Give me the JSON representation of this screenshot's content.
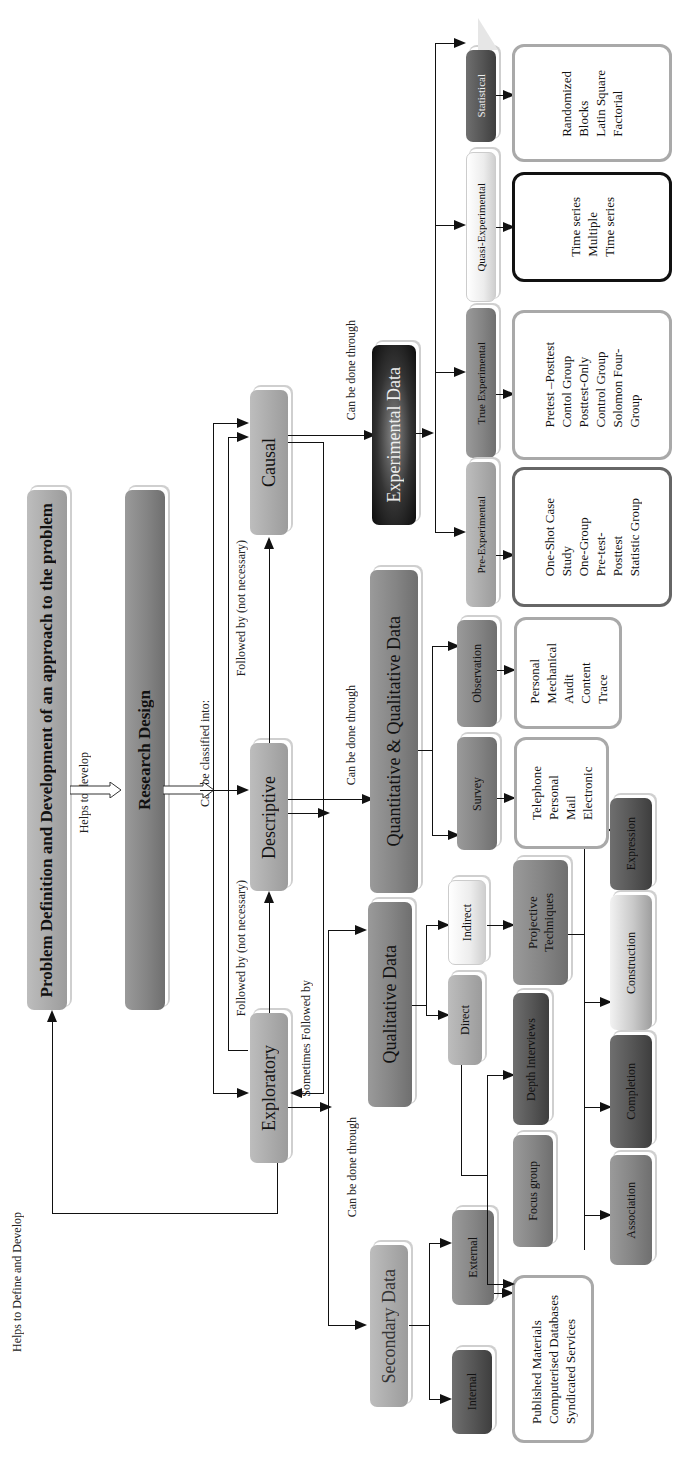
{
  "top": {
    "problem_definition": "Problem Definition and Development of an approach to the problem",
    "helps_to_develop": "Helps to develop",
    "research_design": "Research Design",
    "can_be_classified_into": "Can be classified into:",
    "helps_to_define": "Helps to Define and Develop"
  },
  "designs": {
    "exploratory": "Exploratory",
    "descriptive": "Descriptive",
    "causal": "Causal",
    "followed_by_1": "Followed by (not necessary)",
    "followed_by_2": "Followed by (not necessary)",
    "sometimes_followed_by": "Sometimes Followed by"
  },
  "connectors": {
    "can_be_done_through_secondary": "Can be done through",
    "can_be_done_through_quant": "Can be done through",
    "can_be_done_through_exp": "Can be done through"
  },
  "secondary": {
    "title": "Secondary Data",
    "internal": "Internal",
    "external": "External",
    "sources": [
      "Published Materials",
      "Computerised Databases",
      "Syndicated Services"
    ]
  },
  "qualitative": {
    "title": "Qualitative Data",
    "direct": "Direct",
    "indirect": "Indirect",
    "focus_group": "Focus group",
    "depth_interviews": "Depth Interviews",
    "projective_1": "Projective",
    "projective_2": "Techniques",
    "techniques": [
      "Association",
      "Completion",
      "Construction",
      "Expression"
    ]
  },
  "quant_qual": {
    "title": "Quantitative & Qualitative Data",
    "survey": "Survey",
    "observation": "Observation",
    "survey_methods": [
      "Telephone",
      "Personal",
      "Mail",
      "Electronic"
    ],
    "observation_methods": [
      "Personal",
      "Mechanical",
      "Audit",
      "Content",
      "Trace"
    ]
  },
  "experimental": {
    "title": "Experimental Data",
    "pre": "Pre-Experimental",
    "true": "True Experimental",
    "quasi": "Quasi-Experimental",
    "statistical": "Statistical",
    "pre_items": [
      "One-Shot Case",
      "Study",
      "",
      "One-Group",
      "Pre-test-",
      "Posttest",
      "",
      "Statistic Group"
    ],
    "true_items": [
      "Pretest –Posttest",
      "Contol Group",
      "",
      "Posttest-Only",
      "Control Group",
      "",
      "Solomon Four-",
      "Group"
    ],
    "quasi_items": [
      "Time series",
      "",
      "Multiple",
      "Time series"
    ],
    "statistical_items": [
      "Randomized",
      "Blocks",
      "",
      "Latin Square",
      "",
      "Factorial"
    ]
  }
}
